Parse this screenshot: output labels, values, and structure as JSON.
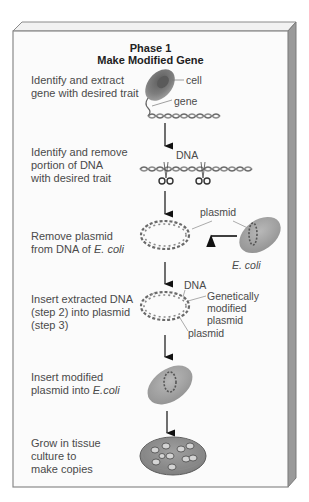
{
  "diagram": {
    "title": {
      "line1": "Phase 1",
      "line2": "Make Modified Gene"
    },
    "colors": {
      "panel_face": "#fbfbfb",
      "panel_border": "#8a8a8a",
      "panel_side": "#9a9a9a",
      "panel_top": "#f2f2f2",
      "cell_body": "#7a7a7a",
      "ecoli_body": "#a8a8a8",
      "dna_strand": "#6a6a6a",
      "arrow": "#111111",
      "text": "#4a4a4a"
    },
    "steps": [
      {
        "id": 1,
        "lines": [
          "Identify and extract",
          "gene with desired trait"
        ],
        "labels": {
          "cell": "cell",
          "gene": "gene"
        },
        "icon": "cell-with-gene"
      },
      {
        "id": 2,
        "lines": [
          "Identify and remove",
          "portion of DNA",
          "with desired trait"
        ],
        "labels": {
          "dna": "DNA"
        },
        "icon": "dna-cut-with-scissors"
      },
      {
        "id": 3,
        "line1": "Remove plasmid",
        "line2_prefix": "from DNA of ",
        "line2_italic": "E. coli",
        "labels": {
          "plasmid": "plasmid",
          "ecoli": "E. coli"
        },
        "icon": "plasmid-ring"
      },
      {
        "id": 4,
        "lines": [
          "Insert extracted DNA",
          "(step 2) into plasmid",
          "(step 3)"
        ],
        "labels": {
          "dna": "DNA",
          "modified_1": "Genetically",
          "modified_2": "modified",
          "modified_3": "plasmid",
          "plasmid": "plasmid"
        },
        "icon": "modified-plasmid"
      },
      {
        "id": 5,
        "line1": "Insert modified",
        "line2_prefix": "plasmid into ",
        "line2_italic": "E.coli",
        "icon": "ecoli-with-plasmid"
      },
      {
        "id": 6,
        "lines": [
          "Grow in tissue",
          "culture to",
          "make copies"
        ],
        "icon": "culture-dish"
      }
    ]
  }
}
